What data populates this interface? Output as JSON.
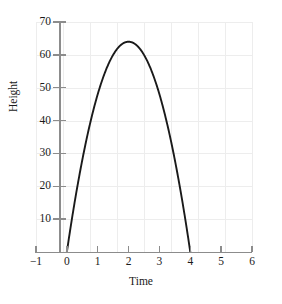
{
  "chart_data": {
    "type": "line",
    "title": "",
    "xlabel": "Time",
    "ylabel": "Height",
    "xlim": [
      -1,
      6
    ],
    "ylim": [
      0,
      70
    ],
    "xticks": [
      -1,
      0,
      1,
      2,
      3,
      4,
      5,
      6
    ],
    "xtick_labels": [
      "−1",
      "0",
      "1",
      "2",
      "3",
      "4",
      "5",
      "6"
    ],
    "yticks": [
      10,
      20,
      30,
      40,
      50,
      60,
      70
    ],
    "ytick_labels": [
      "10",
      "20",
      "30",
      "40",
      "50",
      "60",
      "70"
    ],
    "grid": true,
    "legend": "none",
    "curve_color": "#1a1a1a",
    "grid_color": "#ededed",
    "axis_color": "#8c8c8c",
    "equation": "h = 64t - 16t^2",
    "vertex": {
      "x": 2,
      "y": 64
    },
    "roots": [
      0,
      4
    ],
    "series": [
      {
        "name": "Height vs Time",
        "x": [
          0,
          0.25,
          0.5,
          0.75,
          1,
          1.25,
          1.5,
          1.75,
          2,
          2.25,
          2.5,
          2.75,
          3,
          3.25,
          3.5,
          3.75,
          4
        ],
        "values": [
          0,
          15,
          28,
          39,
          48,
          55,
          60,
          63,
          64,
          63,
          60,
          55,
          48,
          39,
          28,
          15,
          0
        ]
      }
    ]
  },
  "axes": {
    "ylabel": "Height",
    "xlabel": "Time"
  }
}
